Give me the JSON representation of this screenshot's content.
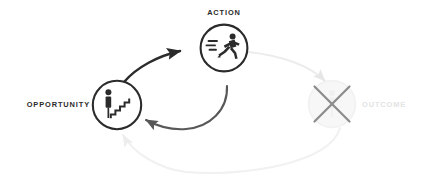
{
  "diagram": {
    "background_color": "#ffffff",
    "nodes": [
      {
        "id": "opportunity",
        "label": "OPPORTUNITY",
        "icon": "person-stairs-icon",
        "state": "active",
        "color": "#2b2b2b",
        "cx": 117,
        "cy": 105,
        "r": 25
      },
      {
        "id": "action",
        "label": "ACTION",
        "icon": "running-person-icon",
        "state": "active",
        "color": "#2b2b2b",
        "cx": 224,
        "cy": 48,
        "r": 24
      },
      {
        "id": "outcome",
        "label": "OUTCOME",
        "icon": "crossed-out-icon",
        "state": "disabled",
        "color": "#e3e3e3",
        "cross_color": "#8c8c8c",
        "cx": 332,
        "cy": 104,
        "r": 24
      }
    ],
    "edges": [
      {
        "id": "opportunity-to-action",
        "from": "opportunity",
        "to": "action",
        "style": "solid-bold",
        "color": "#2b2b2b",
        "has_arrowhead": true
      },
      {
        "id": "action-to-outcome",
        "from": "action",
        "to": "outcome",
        "style": "faded",
        "color": "#ececec",
        "has_arrowhead": true
      },
      {
        "id": "outcome-to-opportunity",
        "from": "outcome",
        "to": "opportunity",
        "style": "faded",
        "color": "#f0f0f0",
        "has_arrowhead": true
      },
      {
        "id": "action-back-to-opportunity",
        "from": "action",
        "to": "opportunity",
        "style": "solid-medium",
        "color": "#585858",
        "has_arrowhead": true
      }
    ]
  }
}
